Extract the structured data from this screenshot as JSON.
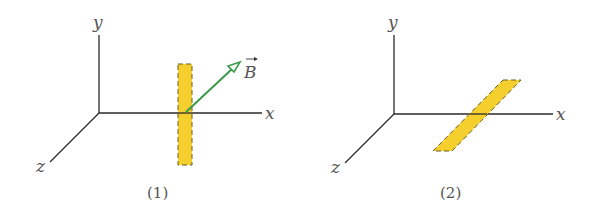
{
  "figures": [
    {
      "caption": "(1)",
      "axes": {
        "x": "x",
        "y": "y",
        "z": "z"
      },
      "strip_orientation": "vertical (along y-axis)",
      "field_vector_label": "B",
      "field_vector_color": "#3a9a4a"
    },
    {
      "caption": "(2)",
      "axes": {
        "x": "x",
        "y": "y",
        "z": "z"
      },
      "strip_orientation": "horizontal (along z-axis, in xz-plane)"
    }
  ],
  "colors": {
    "axis": "#2a2a2a",
    "strip_fill": "#f5cf2e",
    "strip_edge": "#6b5a20",
    "vector": "#3a9a4a",
    "text": "#555555"
  }
}
